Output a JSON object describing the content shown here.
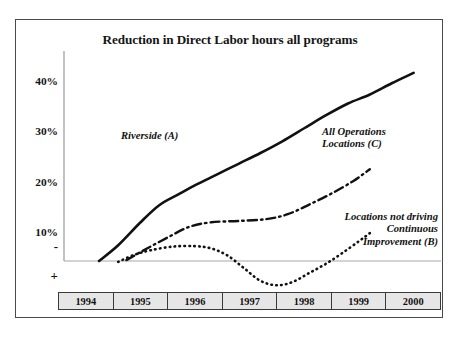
{
  "chart_data": {
    "type": "line",
    "title": "Reduction in Direct Labor hours all programs",
    "xlabel": "",
    "ylabel": "",
    "categories": [
      "1994",
      "1995",
      "1996",
      "1997",
      "1998",
      "1999",
      "2000"
    ],
    "ytick_labels": [
      "40%",
      "30%",
      "20%",
      "10%",
      "-"
    ],
    "ytick_values": [
      40,
      30,
      20,
      10,
      0
    ],
    "ylim": [
      -5,
      45
    ],
    "xlim": [
      1994,
      2000
    ],
    "grid": false,
    "legend_position": "inline-annotations",
    "below_axis_sign": "+",
    "above_axis_sign": "-",
    "series": [
      {
        "name": "Riverside (A)",
        "label_lines": [
          "Riverside (A)"
        ],
        "style": "solid",
        "color": "#111111",
        "x": [
          1994.25,
          1994.6,
          1995.0,
          1995.35,
          1995.7,
          1996.0,
          1996.4,
          1996.8,
          1997.2,
          1997.6,
          1998.0,
          1998.4,
          1998.8,
          1999.2,
          1999.6,
          2000.0
        ],
        "values": [
          0,
          3.5,
          8.5,
          12.4,
          14.8,
          16.8,
          19.2,
          21.6,
          24.0,
          26.6,
          29.5,
          32.4,
          35.0,
          37.0,
          39.5,
          41.8
        ]
      },
      {
        "name": "All Operations Locations (C)",
        "label_lines": [
          "All Operations",
          "Locations (C)"
        ],
        "style": "dash-dot",
        "color": "#111111",
        "x": [
          1994.75,
          1995.1,
          1995.5,
          1995.9,
          1996.3,
          1996.8,
          1997.3,
          1997.7,
          1998.1,
          1998.5,
          1998.9,
          1999.2
        ],
        "values": [
          0.2,
          2.6,
          5.2,
          7.6,
          8.6,
          8.9,
          9.3,
          10.4,
          12.6,
          15.0,
          17.8,
          20.4
        ]
      },
      {
        "name": "Locations not driving Continuous Improvement (B)",
        "label_lines": [
          "Locations not driving",
          "Continuous",
          "Improvement (B)"
        ],
        "style": "dotted",
        "color": "#111111",
        "x": [
          1994.6,
          1994.9,
          1995.2,
          1995.6,
          1996.0,
          1996.3,
          1996.6,
          1996.9,
          1997.2,
          1997.5,
          1997.8,
          1998.1,
          1998.4,
          1998.7,
          1999.0,
          1999.2
        ],
        "values": [
          -0.2,
          1.4,
          2.4,
          3.2,
          3.3,
          2.8,
          1.2,
          -1.6,
          -4.4,
          -5.4,
          -4.6,
          -2.6,
          -0.6,
          1.8,
          4.4,
          6.2
        ]
      }
    ]
  },
  "axes": {
    "y_ticks": [
      {
        "label": "40%",
        "top": 55
      },
      {
        "label": "30%",
        "top": 105
      },
      {
        "label": "20%",
        "top": 156
      },
      {
        "label": "10%",
        "top": 206
      }
    ],
    "minus_sign": "-",
    "plus_sign": "+"
  },
  "annotations": {
    "riverside": {
      "line1": "Riverside (A)"
    },
    "all_operations": {
      "line1": "All Operations",
      "line2": "Locations (C)"
    },
    "not_driving": {
      "line1": "Locations not driving",
      "line2": "Continuous",
      "line3": "Improvement (B)"
    }
  },
  "colors": {
    "frame_border": "#4a4a4a",
    "line_color": "#111111",
    "zero_line": "#a8a8a8",
    "axis_line": "#8f8f8f",
    "year_cell_fill": "#e6e6e6",
    "year_cell_border": "#3a3a3a",
    "text": "#121212",
    "background": "#ffffff"
  }
}
